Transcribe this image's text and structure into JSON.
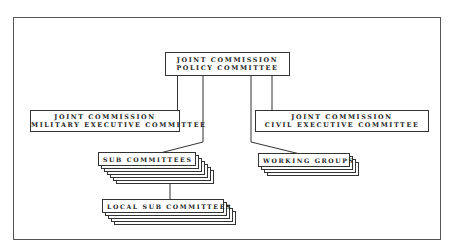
{
  "diagram": {
    "type": "organization-chart",
    "nodes": {
      "policy": {
        "line1": "JOINT COMMISSION",
        "line2": "POLICY COMMITTEE"
      },
      "military": {
        "line1": "JOINT COMMISSION",
        "line2": "MILITARY EXECUTIVE COMMITTEE"
      },
      "civil": {
        "line1": "JOINT COMMISSION",
        "line2": "CIVIL EXECUTIVE COMMITTEE"
      },
      "sub_committees": {
        "label": "SUB COMMITTEES"
      },
      "working_groups": {
        "label": "WORKING GROUPS"
      },
      "local_sub_committees": {
        "label": "LOCAL SUB COMMITTEES"
      }
    },
    "edges": [
      {
        "from": "policy",
        "to": "military"
      },
      {
        "from": "policy",
        "to": "civil"
      },
      {
        "from": "policy",
        "to": "sub_committees"
      },
      {
        "from": "policy",
        "to": "working_groups"
      },
      {
        "from": "sub_committees",
        "to": "local_sub_committees"
      }
    ]
  }
}
